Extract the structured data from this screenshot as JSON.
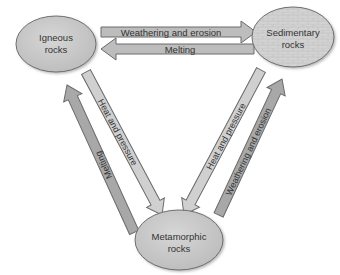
{
  "diagram": {
    "nodes": {
      "igneous": {
        "line1": "Igneous",
        "line2": "rocks"
      },
      "sedimentary": {
        "line1": "Sedimentary",
        "line2": "rocks"
      },
      "metamorphic": {
        "line1": "Metamorphic",
        "line2": "rocks"
      }
    },
    "arrows": {
      "igneous_to_sedimentary": "Weathering and erosion",
      "sedimentary_to_igneous": "Melting",
      "igneous_to_metamorphic": "Heat and pressure",
      "metamorphic_to_igneous": "Melting",
      "sedimentary_to_metamorphic": "Heat and pressure",
      "metamorphic_to_sedimentary": "Weathering and erosion"
    },
    "colors": {
      "node_fill": "#c8c8c8",
      "node_stroke": "#6e6e6e",
      "arrow_light": "#cfcfcf",
      "arrow_dark": "#a5a5a5",
      "arrow_stroke": "#6a6a6a",
      "text": "#333333"
    }
  }
}
